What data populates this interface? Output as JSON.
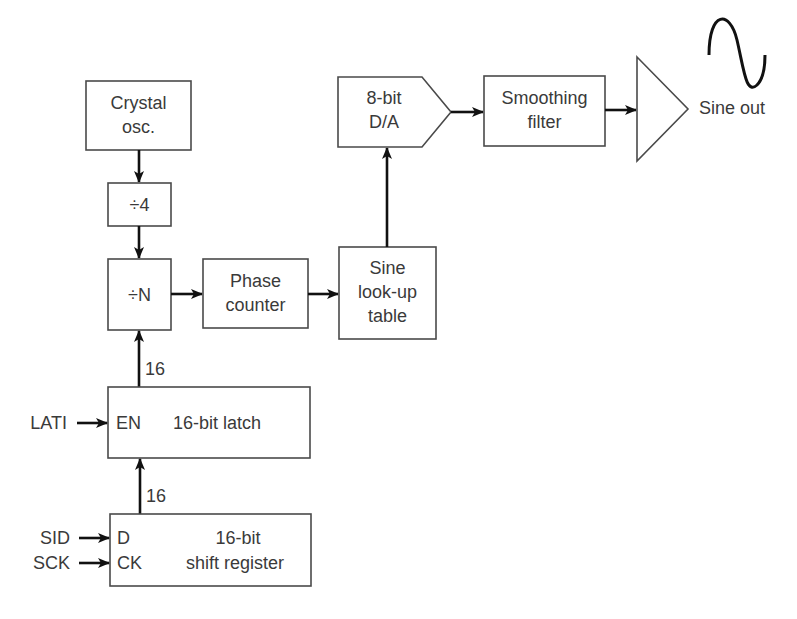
{
  "diagram": {
    "title": "",
    "blocks": {
      "crystal_osc": {
        "line1": "Crystal",
        "line2": "osc."
      },
      "div4": {
        "label": "÷4"
      },
      "divN": {
        "label": "÷N"
      },
      "phase_counter": {
        "line1": "Phase",
        "line2": "counter"
      },
      "sine_table": {
        "line1": "Sine",
        "line2": "look-up",
        "line3": "table"
      },
      "dac": {
        "line1": "8-bit",
        "line2": "D/A"
      },
      "smoothing_filter": {
        "line1": "Smoothing",
        "line2": "filter"
      },
      "amplifier": {
        "label": ""
      },
      "latch": {
        "pin_en": "EN",
        "label": "16-bit latch"
      },
      "shift_register": {
        "pin_d": "D",
        "pin_ck": "CK",
        "line1": "16-bit",
        "line2": "shift register"
      }
    },
    "inputs": {
      "lati": "LATI",
      "sid": "SID",
      "sck": "SCK"
    },
    "bus_widths": {
      "latch_to_divN": "16",
      "shift_to_latch": "16"
    },
    "output": {
      "label": "Sine out",
      "icon": "sine-wave-icon"
    },
    "colors": {
      "line": "#111111",
      "box_stroke": "#4a4a4a",
      "text": "#3a3a3a",
      "background": "#ffffff"
    }
  }
}
